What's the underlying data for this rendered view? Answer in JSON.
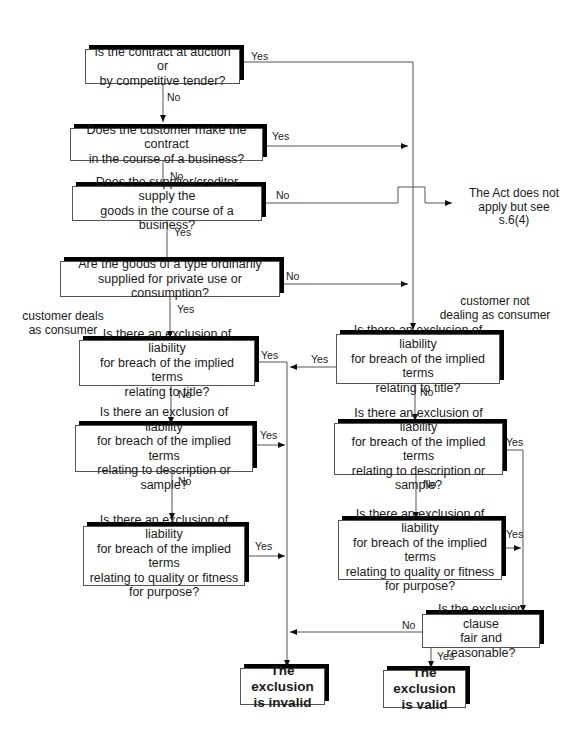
{
  "diagram": {
    "type": "flowchart",
    "nodes": {
      "q_auction": "Is the contract at auction or\nby competitive tender?",
      "q_customer_business": "Does the customer make the contract\nin the course of a business?",
      "q_supplier_business": "Does the supplier/creditor supply the\ngoods in the course of a business?",
      "q_private_use": "Are the goods of a type ordinarily\nsupplied for private use or consumption?",
      "l_title": "Is there an exclusion of liability\nfor breach of the implied terms\nrelating to title?",
      "l_description": "Is there an exclusion of liability\nfor breach of the implied terms\nrelating to description or sample?",
      "l_quality": "Is there an exclusion of liability\nfor breach of the implied terms\nrelating to quality or fitness\nfor purpose?",
      "r_title": "Is there an exclusion of liability\nfor breach of the implied terms\nrelating to title?",
      "r_description": "Is there an exclusion of liability\nfor breach of the implied terms\nrelating to description or sample?",
      "r_quality": "Is there an exclusion of liability\nfor breach of the implied terms\nrelating to quality or fitness\nfor purpose?",
      "q_fair": "Is the exclusion clause\nfair and reasonable?",
      "res_invalid": "The exclusion\nis invalid",
      "res_valid": "The exclusion\nis valid"
    },
    "notes": {
      "act_not_apply": "The Act does not\napply but see s.6(4)",
      "deals_as_consumer": "customer deals\nas consumer",
      "not_consumer": "customer not\ndealing as consumer"
    },
    "edge_labels": {
      "yes": "Yes",
      "no": "No"
    }
  }
}
